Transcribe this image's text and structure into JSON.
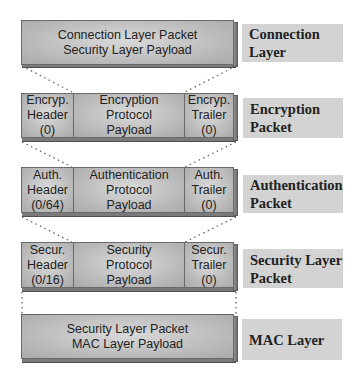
{
  "layers": [
    {
      "id": "connection",
      "label_line1": "Connection",
      "label_line2": "Layer",
      "payload": "Connection Layer Packet\nSecurity Layer Payload"
    },
    {
      "id": "encryption",
      "label_line1": "Encryption",
      "label_line2": "Packet",
      "header": "Encryp.\nHeader\n(0)",
      "payload": "Encryption\nProtocol\nPayload",
      "trailer": "Encryp.\nTrailer\n(0)"
    },
    {
      "id": "authentication",
      "label_line1": "Authentication",
      "label_line2": "Packet",
      "header": "Auth.\nHeader\n(0/64)",
      "payload": "Authentication\nProtocol\nPayload",
      "trailer": "Auth.\nTrailer\n(0)"
    },
    {
      "id": "security",
      "label_line1": "Security Layer",
      "label_line2": "Packet",
      "header": "Secur.\nHeader\n(0/16)",
      "payload": "Security\nProtocol\nPayload",
      "trailer": "Secur.\nTrailer\n(0)"
    },
    {
      "id": "mac",
      "label_line1": "MAC Layer",
      "label_line2": "",
      "payload": "Security Layer Packet\nMAC Layer Payload"
    }
  ],
  "colors": {
    "box_face_center": "#d9d9d9",
    "box_face_edge": "#a9a9a9",
    "box_side": "#7a7a7a",
    "label_bg": "#d3d3d3",
    "connector": "#666666"
  }
}
